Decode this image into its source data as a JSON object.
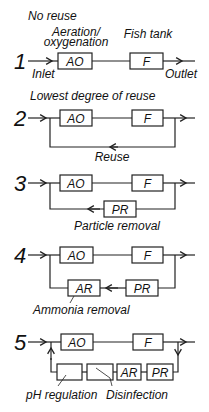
{
  "labels": {
    "ao": "AO",
    "f": "F",
    "pr": "PR",
    "ar": "AR"
  },
  "schemes": [
    {
      "number": "1",
      "caption": "No reuse",
      "annotations": {
        "ao": "Aeration/",
        "ao_line2": "oxygenation",
        "f": "Fish tank",
        "inlet": "Inlet",
        "outlet": "Outlet"
      }
    },
    {
      "number": "2",
      "caption": "Lowest degree of reuse",
      "loop_label": "Reuse"
    },
    {
      "number": "3",
      "loop_label": "Particle removal"
    },
    {
      "number": "4",
      "loop_label": "Ammonia removal"
    },
    {
      "number": "5",
      "annotations": {
        "ph": "pH regulation",
        "disinfection": "Disinfection"
      }
    }
  ]
}
